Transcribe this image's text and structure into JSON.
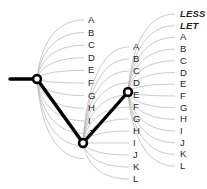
{
  "diagram": {
    "background_color": "#ffffff",
    "arc_color": "#b3b3b3",
    "path_color": "#000000",
    "text_color": "#231f20",
    "columns": [
      {
        "name": "column-1",
        "x": 88,
        "label_top": 20,
        "label_step": 12.6,
        "labels": [
          "A",
          "B",
          "C",
          "D",
          "E",
          "F",
          "G",
          "H",
          "I",
          "J"
        ],
        "bold_labels": []
      },
      {
        "name": "column-2",
        "x": 133,
        "label_top": 47,
        "label_step": 12.0,
        "labels": [
          "A",
          "B",
          "C",
          "D",
          "E",
          "F",
          "G",
          "H",
          "I",
          "J",
          "K",
          "L"
        ],
        "bold_labels": []
      },
      {
        "name": "column-3",
        "x": 180,
        "label_top": 14,
        "label_step": 11.7,
        "labels": [
          "LESS",
          "LET",
          "A",
          "B",
          "C",
          "D",
          "E",
          "F",
          "G",
          "H",
          "I",
          "J",
          "K",
          "L"
        ],
        "bold_labels": [
          "LESS",
          "LET"
        ]
      }
    ],
    "nodes": [
      {
        "name": "node-root",
        "x": 37,
        "y": 79,
        "r": 5.2
      },
      {
        "name": "node-second",
        "x": 83,
        "y": 143,
        "r": 5.2
      },
      {
        "name": "node-third",
        "x": 128,
        "y": 92,
        "r": 5.2
      }
    ],
    "path_segments": [
      {
        "name": "segment-entry",
        "x1": 10,
        "y1": 79,
        "x2": 37,
        "y2": 79
      },
      {
        "name": "segment-root-to-second",
        "x1": 37,
        "y1": 79,
        "x2": 83,
        "y2": 143
      },
      {
        "name": "segment-second-to-third",
        "x1": 83,
        "y1": 143,
        "x2": 128,
        "y2": 92
      }
    ],
    "fans": [
      {
        "name": "fan-1",
        "origin_x": 37,
        "origin_y": 79,
        "target_x": 84,
        "count": 12,
        "target_top": 20,
        "target_step": 12.6
      },
      {
        "name": "fan-2",
        "origin_x": 83,
        "origin_y": 143,
        "target_x": 129,
        "count": 12,
        "target_top": 47,
        "target_step": 12.0
      },
      {
        "name": "fan-3",
        "origin_x": 128,
        "origin_y": 92,
        "target_x": 175,
        "count": 14,
        "target_top": 14,
        "target_step": 11.7
      }
    ]
  }
}
